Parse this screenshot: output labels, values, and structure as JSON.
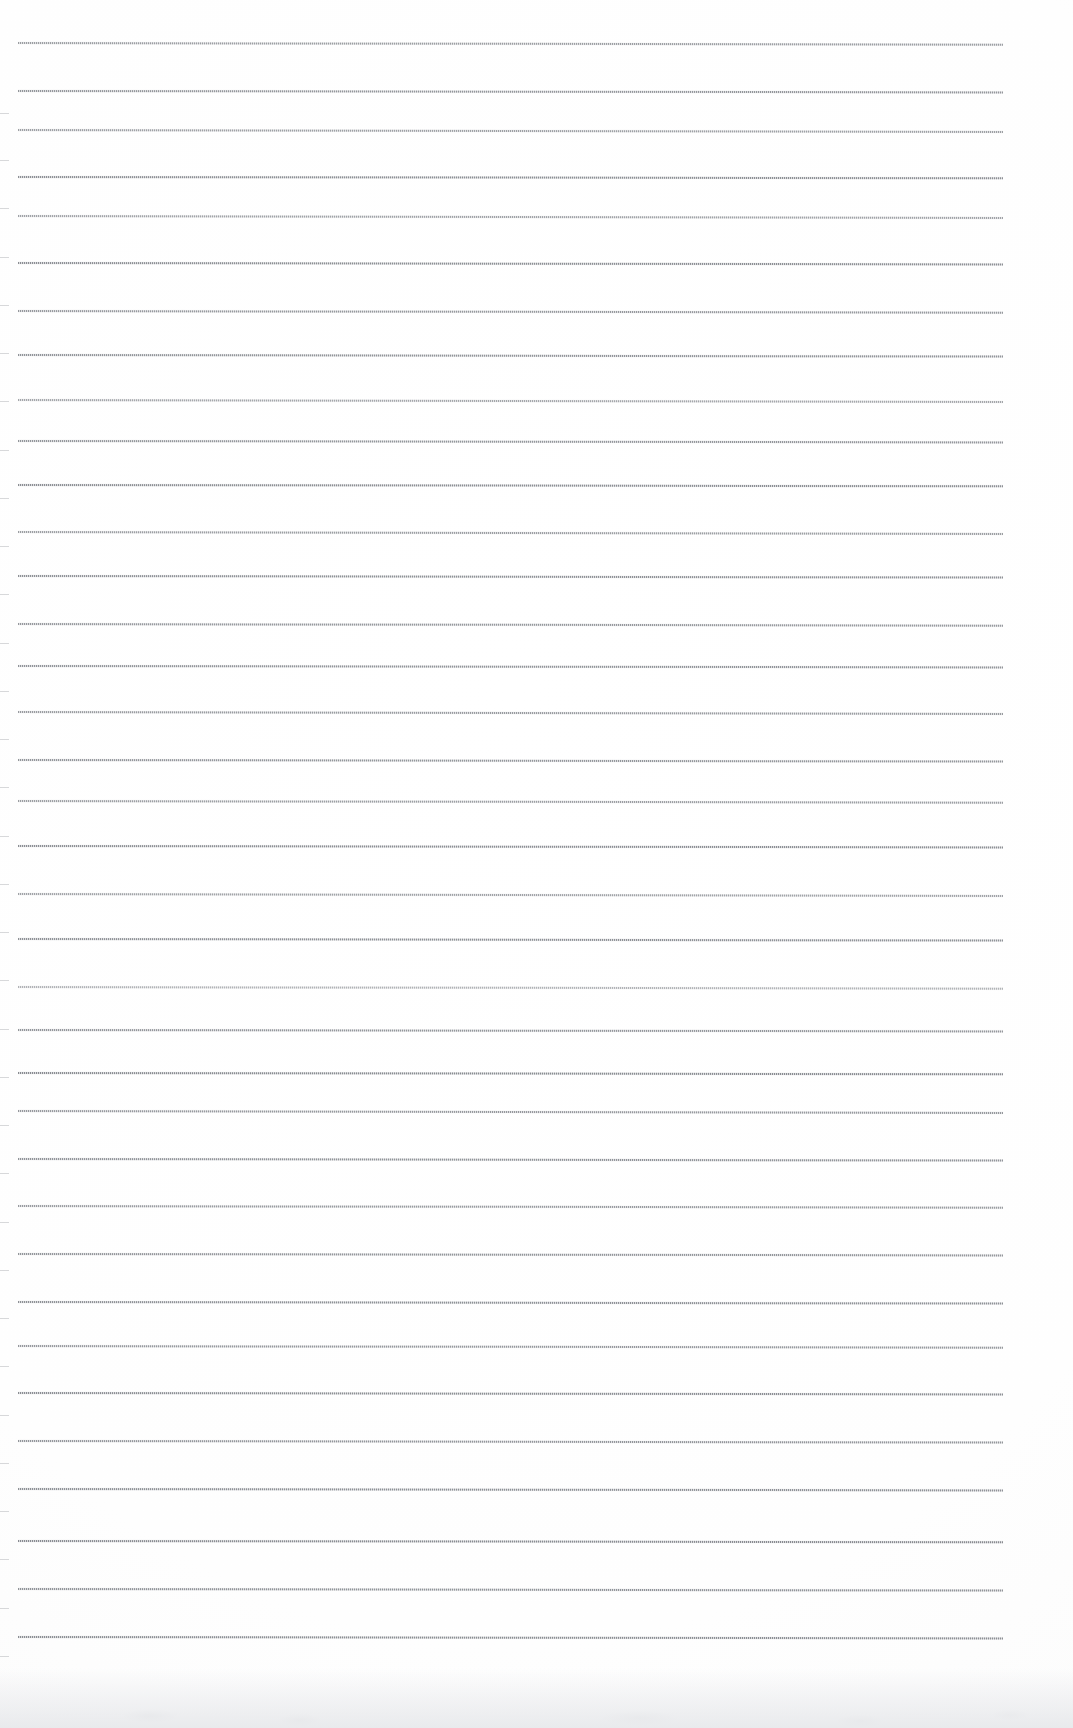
{
  "document": {
    "kind": "scanned-ruled-paper",
    "title": "Ruled Notebook Paper",
    "page_width": 1073,
    "page_height": 1728,
    "background_color": "#fdfdfd",
    "text_content": "",
    "visible_text": []
  },
  "paper": {
    "rule_color_dark": "#6c7076",
    "rule_color_light": "#a0a4aa",
    "rule_thickness_px": 2,
    "rule_left_x": 18,
    "rule_right_x": 1003,
    "rule_width_px": 985,
    "first_rule_y": 42,
    "last_rule_y": 1636,
    "rule_spacing_px": 48.3,
    "rule_count": 34,
    "rule_tilt_deg": 0.09,
    "left_edge_stub_width_px": 9,
    "bottom_shadow_height_px": 60
  },
  "rules": [
    {
      "y": 42,
      "opacity": 0.74,
      "tilt": 0.1
    },
    {
      "y": 90,
      "opacity": 0.8,
      "tilt": 0.08
    },
    {
      "y": 129,
      "opacity": 0.72,
      "tilt": 0.11
    },
    {
      "y": 176,
      "opacity": 0.85,
      "tilt": 0.07
    },
    {
      "y": 215,
      "opacity": 0.7,
      "tilt": 0.12
    },
    {
      "y": 262,
      "opacity": 0.86,
      "tilt": 0.08
    },
    {
      "y": 310,
      "opacity": 0.78,
      "tilt": 0.1
    },
    {
      "y": 354,
      "opacity": 0.82,
      "tilt": 0.09
    },
    {
      "y": 399,
      "opacity": 0.68,
      "tilt": 0.12
    },
    {
      "y": 440,
      "opacity": 0.8,
      "tilt": 0.08
    },
    {
      "y": 484,
      "opacity": 0.86,
      "tilt": 0.07
    },
    {
      "y": 531,
      "opacity": 0.74,
      "tilt": 0.11
    },
    {
      "y": 575,
      "opacity": 0.84,
      "tilt": 0.09
    },
    {
      "y": 623,
      "opacity": 0.78,
      "tilt": 0.1
    },
    {
      "y": 665,
      "opacity": 0.82,
      "tilt": 0.08
    },
    {
      "y": 711,
      "opacity": 0.76,
      "tilt": 0.11
    },
    {
      "y": 759,
      "opacity": 0.8,
      "tilt": 0.09
    },
    {
      "y": 800,
      "opacity": 0.74,
      "tilt": 0.1
    },
    {
      "y": 845,
      "opacity": 0.86,
      "tilt": 0.08
    },
    {
      "y": 893,
      "opacity": 0.7,
      "tilt": 0.12
    },
    {
      "y": 938,
      "opacity": 0.84,
      "tilt": 0.09
    },
    {
      "y": 986,
      "opacity": 0.58,
      "tilt": 0.1
    },
    {
      "y": 1029,
      "opacity": 0.8,
      "tilt": 0.08
    },
    {
      "y": 1072,
      "opacity": 0.88,
      "tilt": 0.07
    },
    {
      "y": 1110,
      "opacity": 0.78,
      "tilt": 0.11
    },
    {
      "y": 1158,
      "opacity": 0.82,
      "tilt": 0.09
    },
    {
      "y": 1205,
      "opacity": 0.76,
      "tilt": 0.1
    },
    {
      "y": 1253,
      "opacity": 0.8,
      "tilt": 0.08
    },
    {
      "y": 1301,
      "opacity": 0.84,
      "tilt": 0.09
    },
    {
      "y": 1345,
      "opacity": 0.78,
      "tilt": 0.1
    },
    {
      "y": 1392,
      "opacity": 0.86,
      "tilt": 0.08
    },
    {
      "y": 1440,
      "opacity": 0.8,
      "tilt": 0.09
    },
    {
      "y": 1488,
      "opacity": 0.84,
      "tilt": 0.08
    },
    {
      "y": 1540,
      "opacity": 0.88,
      "tilt": 0.07
    },
    {
      "y": 1588,
      "opacity": 0.82,
      "tilt": 0.09
    },
    {
      "y": 1636,
      "opacity": 0.86,
      "tilt": 0.08
    }
  ],
  "edge_stubs": [
    {
      "y": 113
    },
    {
      "y": 160
    },
    {
      "y": 208
    },
    {
      "y": 257
    },
    {
      "y": 305
    },
    {
      "y": 353
    },
    {
      "y": 401
    },
    {
      "y": 450
    },
    {
      "y": 498
    },
    {
      "y": 546
    },
    {
      "y": 594
    },
    {
      "y": 643
    },
    {
      "y": 691
    },
    {
      "y": 739
    },
    {
      "y": 787
    },
    {
      "y": 836
    },
    {
      "y": 884
    },
    {
      "y": 932
    },
    {
      "y": 980
    },
    {
      "y": 1029
    },
    {
      "y": 1077
    },
    {
      "y": 1125
    },
    {
      "y": 1173
    },
    {
      "y": 1222
    },
    {
      "y": 1270
    },
    {
      "y": 1318
    },
    {
      "y": 1366
    },
    {
      "y": 1415
    },
    {
      "y": 1463
    },
    {
      "y": 1511
    },
    {
      "y": 1559
    },
    {
      "y": 1608
    },
    {
      "y": 1656
    }
  ]
}
